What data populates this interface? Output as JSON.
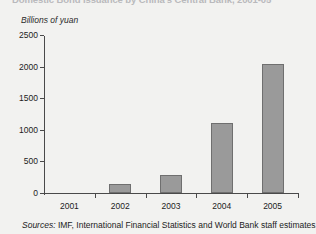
{
  "chart_data": {
    "type": "bar",
    "title": "Domestic Bond Issuance by China's Central Bank, 2001-05",
    "subtitle": "",
    "xlabel": "",
    "ylabel": "Billions of yuan",
    "categories": [
      "2001",
      "2002",
      "2003",
      "2004",
      "2005"
    ],
    "values": [
      0,
      150,
      280,
      1110,
      2040
    ],
    "ylim": [
      0,
      2500
    ],
    "ytick_labels": [
      "0",
      "500",
      "1000",
      "1500",
      "2000",
      "2500"
    ],
    "ytick_values": [
      0,
      500,
      1000,
      1500,
      2000,
      2500
    ],
    "grid": false,
    "legend": "none",
    "series": [
      {
        "name": "Domestic bond issuance",
        "values": [
          0,
          150,
          280,
          1110,
          2040
        ]
      }
    ],
    "bar_color": "#9a9a9a",
    "bar_edge_color": "#6f6f6f",
    "axis_color": "#4a4a4a"
  },
  "source_note": {
    "label": "Sources:",
    "text": " IMF, International Financial Statistics and World Bank staff estimates."
  },
  "figure": {
    "background": "#f2f2f0",
    "text_color": "#1c1c1c"
  }
}
